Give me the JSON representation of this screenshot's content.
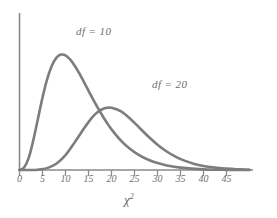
{
  "chart_data": {
    "type": "line",
    "title": "",
    "subtitle": "",
    "xlabel": "χ²",
    "ylabel": "",
    "xlim": [
      0,
      50
    ],
    "ylim": [
      0,
      0.1
    ],
    "grid": false,
    "legend_position": "inline-annotations",
    "xticks": [
      0,
      5,
      10,
      15,
      20,
      25,
      30,
      35,
      40,
      45
    ],
    "xtick_labels": [
      "0",
      "5",
      "10",
      "15",
      "20",
      "25",
      "30",
      "35",
      "40",
      "45"
    ],
    "yticks": [],
    "ytick_labels": [],
    "annotations": [
      {
        "text": "df = 10",
        "x": 11,
        "y": 0.082
      },
      {
        "text": "df = 20",
        "x": 27,
        "y": 0.055
      }
    ],
    "series": [
      {
        "name": "df = 10",
        "df": 10,
        "color": "#7d7d7d",
        "peak_x": 8,
        "x": [
          0,
          1,
          2,
          3,
          4,
          5,
          6,
          7,
          8,
          9,
          10,
          11,
          12,
          13,
          14,
          15,
          16,
          17,
          18,
          19,
          20,
          22,
          24,
          26,
          28,
          30,
          32,
          35,
          40,
          45,
          50
        ],
        "y": [
          0.0,
          0.0016,
          0.0077,
          0.0189,
          0.0325,
          0.0461,
          0.0577,
          0.0662,
          0.0714,
          0.0735,
          0.073,
          0.0704,
          0.0664,
          0.0615,
          0.0561,
          0.0505,
          0.045,
          0.0397,
          0.0347,
          0.0301,
          0.0259,
          0.0189,
          0.0135,
          0.0094,
          0.0065,
          0.0044,
          0.0029,
          0.0015,
          0.0004,
          0.0001,
          0.0
        ]
      },
      {
        "name": "df = 20",
        "df": 20,
        "color": "#7d7d7d",
        "peak_x": 18,
        "x": [
          0,
          2,
          4,
          6,
          8,
          10,
          12,
          14,
          15,
          16,
          17,
          18,
          19,
          20,
          22,
          24,
          26,
          28,
          30,
          32,
          34,
          36,
          38,
          40,
          42,
          44,
          46,
          48,
          50
        ],
        "y": [
          0.0,
          1e-05,
          0.0002,
          0.0012,
          0.004,
          0.0095,
          0.0176,
          0.0264,
          0.0305,
          0.0341,
          0.0369,
          0.0387,
          0.0396,
          0.0397,
          0.0375,
          0.0328,
          0.0271,
          0.0213,
          0.0161,
          0.0118,
          0.0084,
          0.0058,
          0.0039,
          0.0026,
          0.0017,
          0.0011,
          0.0007,
          0.0004,
          0.0002
        ]
      }
    ],
    "crossing_point": {
      "x": 15,
      "y": 0.0505
    },
    "colors": {
      "curve": "#7d7d7d",
      "axis": "#8a8a8a",
      "text": "#6e6e6e",
      "background": "#ffffff"
    }
  },
  "labels": {
    "df10": "df = 10",
    "df20": "df = 20",
    "axis_title_base": "χ",
    "axis_title_sup": "2"
  },
  "ticks": {
    "t0": "0",
    "t1": "5",
    "t2": "10",
    "t3": "15",
    "t4": "20",
    "t5": "25",
    "t6": "30",
    "t7": "35",
    "t8": "40",
    "t9": "45"
  }
}
